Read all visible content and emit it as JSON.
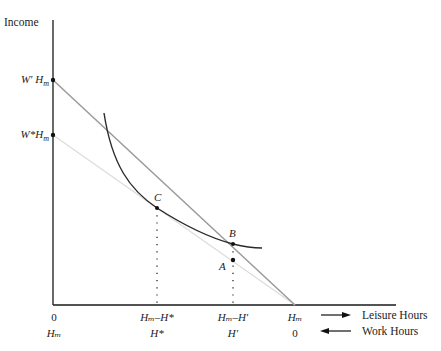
{
  "diagram": {
    "y_axis_label": "Income",
    "y_ticks": [
      {
        "label": "W′ H",
        "sub": "m",
        "y": 80
      },
      {
        "label": "W*H",
        "sub": "m",
        "y": 135
      }
    ],
    "points": [
      {
        "name": "C",
        "x": 157,
        "y": 208
      },
      {
        "name": "B",
        "x": 233,
        "y": 244
      },
      {
        "name": "A",
        "x": 233,
        "y": 260
      }
    ],
    "leisure_row": {
      "ticks": [
        "0",
        "Hₘ–H*",
        "Hₘ–H′",
        "Hₘ"
      ],
      "caption": "Leisure Hours"
    },
    "work_row": {
      "ticks": [
        "Hₘ",
        "H*",
        "H′",
        "0"
      ],
      "caption": "Work Hours"
    },
    "colors": {
      "axis": "#1a1a1a",
      "budget_line_high": "#9a9a9a",
      "budget_line_low": "#dcdcdc",
      "indifference_curve": "#2a2a2a"
    }
  }
}
